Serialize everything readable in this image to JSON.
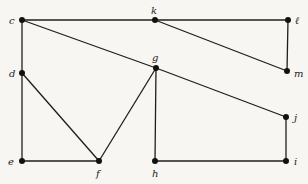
{
  "diagram": {
    "type": "graph",
    "background": "#f7f6f2",
    "edge_color": "#1e1e1e",
    "node_color": "#111111",
    "nodes": [
      {
        "id": "c",
        "label": "c",
        "x": 22,
        "y": 20,
        "lx": 9,
        "ly": 24
      },
      {
        "id": "k",
        "label": "k",
        "x": 155,
        "y": 20,
        "lx": 151,
        "ly": 14
      },
      {
        "id": "l",
        "label": "ℓ",
        "x": 288,
        "y": 20,
        "lx": 295,
        "ly": 24
      },
      {
        "id": "d",
        "label": "d",
        "x": 22,
        "y": 73,
        "lx": 9,
        "ly": 77
      },
      {
        "id": "g",
        "label": "g",
        "x": 156,
        "y": 68,
        "lx": 152,
        "ly": 61
      },
      {
        "id": "m",
        "label": "m",
        "x": 287,
        "y": 71,
        "lx": 294,
        "ly": 77
      },
      {
        "id": "j",
        "label": "j",
        "x": 286,
        "y": 117,
        "lx": 294,
        "ly": 121
      },
      {
        "id": "e",
        "label": "e",
        "x": 22,
        "y": 161,
        "lx": 8,
        "ly": 165
      },
      {
        "id": "f",
        "label": "f",
        "x": 99,
        "y": 161,
        "lx": 96,
        "ly": 177
      },
      {
        "id": "h",
        "label": "h",
        "x": 155,
        "y": 161,
        "lx": 152,
        "ly": 177
      },
      {
        "id": "i",
        "label": "i",
        "x": 286,
        "y": 161,
        "lx": 294,
        "ly": 165
      }
    ],
    "edges": [
      [
        "c",
        "k"
      ],
      [
        "k",
        "l"
      ],
      [
        "l",
        "m"
      ],
      [
        "k",
        "m"
      ],
      [
        "c",
        "d"
      ],
      [
        "d",
        "e"
      ],
      [
        "e",
        "f"
      ],
      [
        "d",
        "f"
      ],
      [
        "c",
        "g"
      ],
      [
        "g",
        "j"
      ],
      [
        "f",
        "g"
      ],
      [
        "g",
        "h"
      ],
      [
        "h",
        "i"
      ],
      [
        "i",
        "j"
      ]
    ]
  }
}
